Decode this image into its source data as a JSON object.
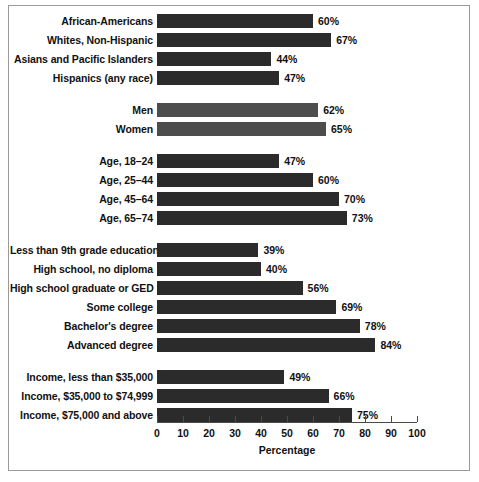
{
  "chart_data": {
    "type": "bar",
    "orientation": "horizontal",
    "title": "",
    "xlabel": "Percentage",
    "ylabel": "",
    "xlim": [
      0,
      100
    ],
    "xticks": [
      0,
      10,
      20,
      30,
      40,
      50,
      60,
      70,
      80,
      90,
      100
    ],
    "grid": false,
    "legend": "none",
    "value_suffix": "%",
    "bar_colors": {
      "default": "#2b2b2b",
      "light": "#4d4d4d"
    },
    "groups": [
      {
        "name": "race-ethnicity",
        "shade": "default",
        "categories": [
          "African-Americans",
          "Whites, Non-Hispanic",
          "Asians and Pacific Islanders",
          "Hispanics (any race)"
        ],
        "values": [
          60,
          67,
          44,
          47
        ],
        "labels": [
          "60%",
          "67%",
          "44%",
          "47%"
        ]
      },
      {
        "name": "sex",
        "shade": "light",
        "categories": [
          "Men",
          "Women"
        ],
        "values": [
          62,
          65
        ],
        "labels": [
          "62%",
          "65%"
        ]
      },
      {
        "name": "age",
        "shade": "default",
        "categories": [
          "Age, 18–24",
          "Age, 25–44",
          "Age, 45–64",
          "Age, 65–74"
        ],
        "values": [
          47,
          60,
          70,
          73
        ],
        "labels": [
          "47%",
          "60%",
          "70%",
          "73%"
        ]
      },
      {
        "name": "education",
        "shade": "default",
        "categories": [
          "Less than 9th grade education",
          "High school, no diploma",
          "High school graduate or GED",
          "Some college",
          "Bachelor's degree",
          "Advanced degree"
        ],
        "values": [
          39,
          40,
          56,
          69,
          78,
          84
        ],
        "labels": [
          "39%",
          "40%",
          "56%",
          "69%",
          "78%",
          "84%"
        ]
      },
      {
        "name": "income",
        "shade": "default",
        "categories": [
          "Income, less than $35,000",
          "Income, $35,000 to $74,999",
          "Income, $75,000 and above"
        ],
        "values": [
          49,
          66,
          75
        ],
        "labels": [
          "49%",
          "66%",
          "75%"
        ]
      }
    ]
  }
}
